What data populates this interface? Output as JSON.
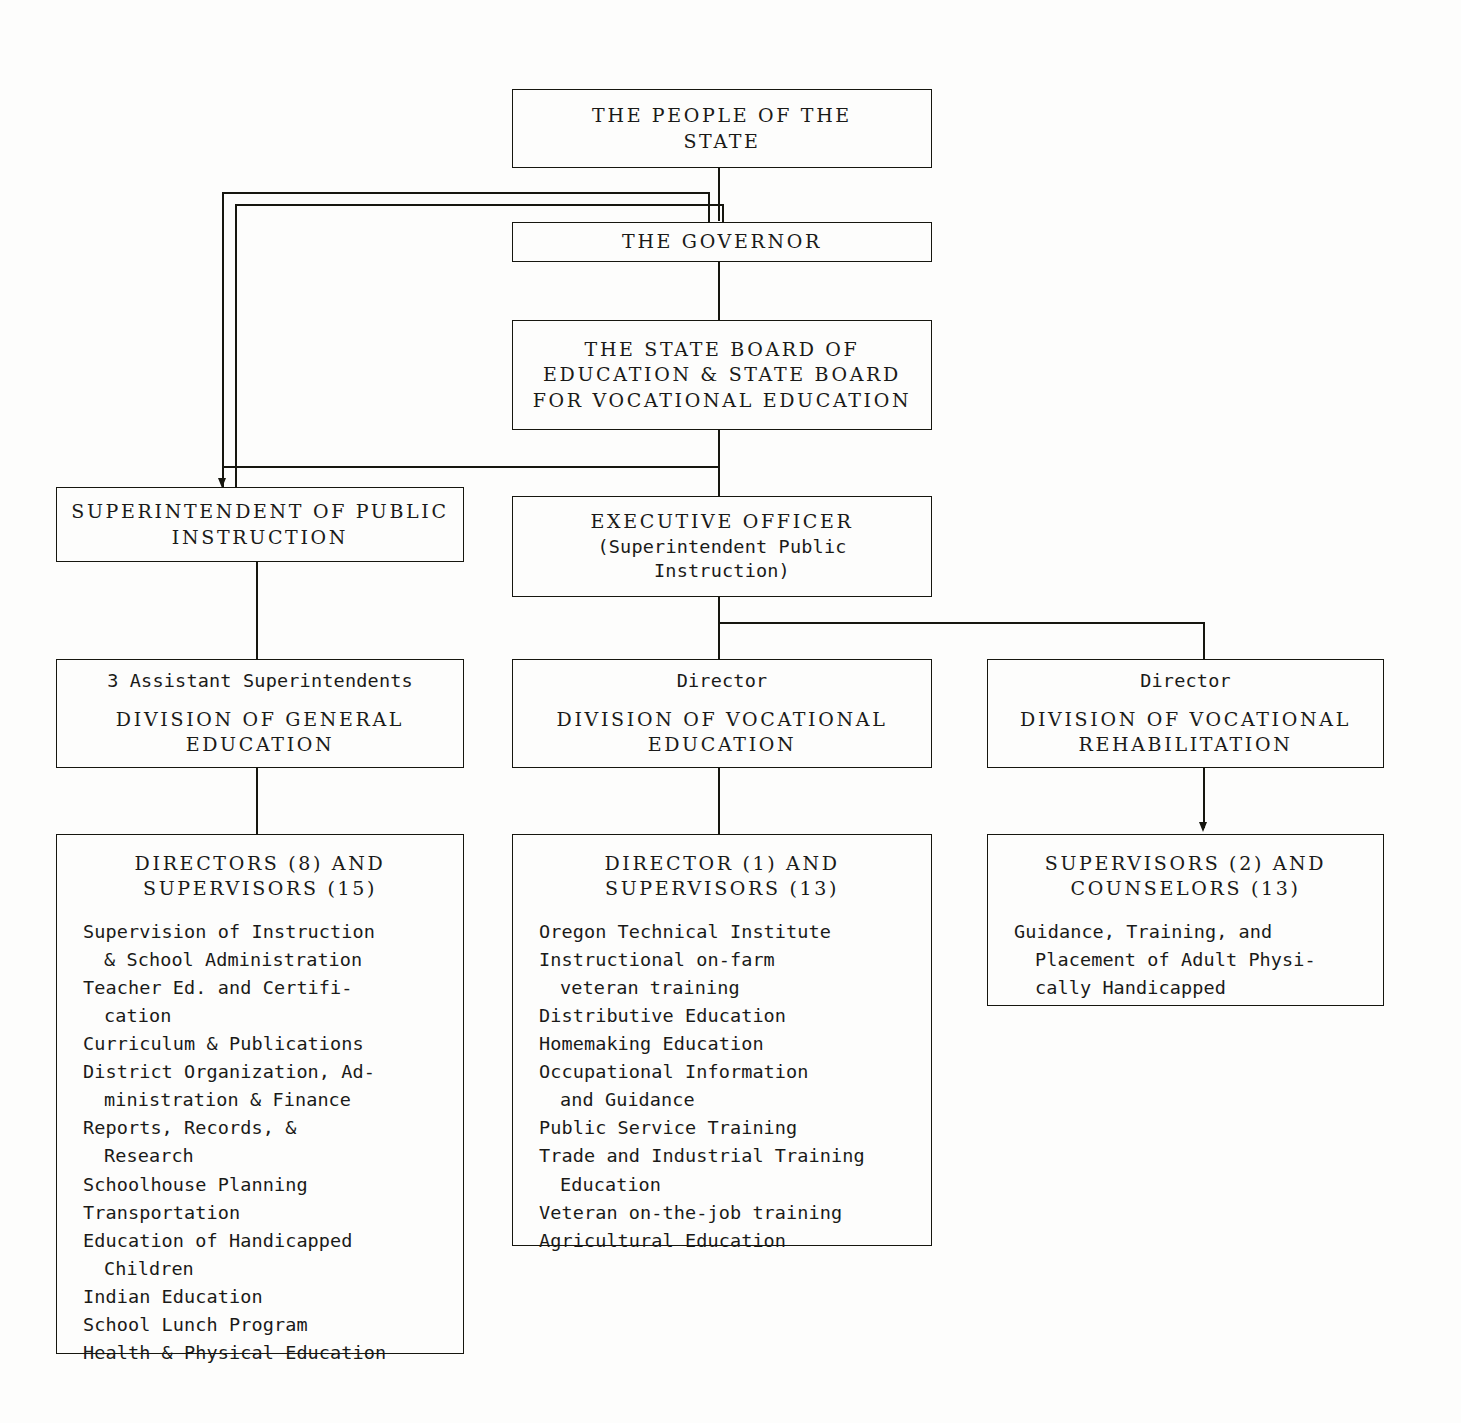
{
  "chart_title": "State Education Organization Chart",
  "nodes": {
    "people": {
      "id": "the-people-of-the-state",
      "lines": [
        "THE PEOPLE OF THE",
        "STATE"
      ]
    },
    "governor": {
      "id": "the-governor",
      "lines": [
        "THE GOVERNOR"
      ]
    },
    "state_board": {
      "id": "state-board-of-education",
      "lines": [
        "THE STATE BOARD OF",
        "EDUCATION & STATE BOARD",
        "FOR VOCATIONAL EDUCATION"
      ]
    },
    "superintendent": {
      "id": "superintendent-of-public-instruction",
      "lines": [
        "SUPERINTENDENT OF PUBLIC",
        "INSTRUCTION"
      ]
    },
    "executive_officer": {
      "id": "executive-officer",
      "lines": [
        "EXECUTIVE OFFICER",
        "(Superintendent Public",
        "Instruction)"
      ]
    },
    "div_general": {
      "id": "division-of-general-education",
      "head": "3 Assistant Superintendents",
      "lines": [
        "DIVISION OF GENERAL",
        "EDUCATION"
      ]
    },
    "div_vocational": {
      "id": "division-of-vocational-education",
      "head": "Director",
      "lines": [
        "DIVISION OF VOCATIONAL",
        "EDUCATION"
      ]
    },
    "div_rehab": {
      "id": "division-of-vocational-rehabilitation",
      "head": "Director",
      "lines": [
        "DIVISION OF VOCATIONAL",
        "REHABILITATION"
      ]
    },
    "general_staff": {
      "id": "general-education-staff",
      "header_lines": [
        "DIRECTORS (8) AND",
        "SUPERVISORS (15)"
      ],
      "items": [
        {
          "text": "Supervision of Instruction",
          "cont": false
        },
        {
          "text": "& School Administration",
          "cont": true
        },
        {
          "text": "Teacher Ed. and Certifi-",
          "cont": false
        },
        {
          "text": "cation",
          "cont": true
        },
        {
          "text": "Curriculum & Publications",
          "cont": false
        },
        {
          "text": "District Organization, Ad-",
          "cont": false
        },
        {
          "text": "ministration & Finance",
          "cont": true
        },
        {
          "text": "Reports, Records, &",
          "cont": false
        },
        {
          "text": "Research",
          "cont": true
        },
        {
          "text": "Schoolhouse Planning",
          "cont": false
        },
        {
          "text": "Transportation",
          "cont": false
        },
        {
          "text": "Education of Handicapped",
          "cont": false
        },
        {
          "text": "Children",
          "cont": true
        },
        {
          "text": "Indian Education",
          "cont": false
        },
        {
          "text": "School Lunch Program",
          "cont": false
        },
        {
          "text": "Health & Physical Education",
          "cont": false
        }
      ]
    },
    "vocational_staff": {
      "id": "vocational-education-staff",
      "header_lines": [
        "DIRECTOR (1) AND",
        "SUPERVISORS (13)"
      ],
      "items": [
        {
          "text": "Oregon Technical Institute",
          "cont": false
        },
        {
          "text": "Instructional on-farm",
          "cont": false
        },
        {
          "text": "veteran training",
          "cont": true
        },
        {
          "text": "Distributive Education",
          "cont": false
        },
        {
          "text": "Homemaking Education",
          "cont": false
        },
        {
          "text": "Occupational Information",
          "cont": false
        },
        {
          "text": "and Guidance",
          "cont": true
        },
        {
          "text": "Public Service Training",
          "cont": false
        },
        {
          "text": "Trade and Industrial Training",
          "cont": false
        },
        {
          "text": "Education",
          "cont": true
        },
        {
          "text": "Veteran on-the-job training",
          "cont": false
        },
        {
          "text": "Agricultural Education",
          "cont": false
        }
      ]
    },
    "rehab_staff": {
      "id": "vocational-rehabilitation-staff",
      "header_lines": [
        "SUPERVISORS (2) AND",
        "COUNSELORS (13)"
      ],
      "items": [
        {
          "text": "Guidance, Training, and",
          "cont": false
        },
        {
          "text": "Placement of Adult Physi-",
          "cont": true
        },
        {
          "text": "cally Handicapped",
          "cont": true
        }
      ]
    }
  },
  "style": {
    "ink": "#16160f",
    "paper": "#fdfdfc"
  }
}
